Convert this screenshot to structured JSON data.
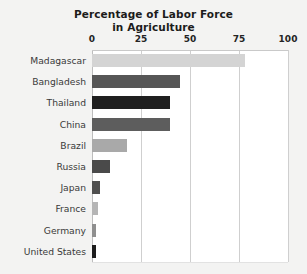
{
  "chart_data": {
    "type": "bar",
    "orientation": "horizontal",
    "title": "Percentage of Labor Force in Agriculture",
    "title_line1": "Percentage of Labor Force",
    "title_line2": "in Agriculture",
    "xlabel": "",
    "ylabel": "",
    "xlim": [
      0,
      100
    ],
    "xticks": [
      0,
      25,
      50,
      75,
      100
    ],
    "xtick_labels": [
      "0",
      "25",
      "50",
      "75",
      "100"
    ],
    "grid": "vertical",
    "legend": "none",
    "categories": [
      "Madagascar",
      "Bangladesh",
      "Thailand",
      "China",
      "Brazil",
      "Russia",
      "Japan",
      "France",
      "Germany",
      "United States"
    ],
    "values": [
      78,
      45,
      40,
      40,
      18,
      9,
      4,
      3,
      2,
      2
    ],
    "bar_colors": [
      "#d4d4d4",
      "#565656",
      "#1f1f1f",
      "#5d5d5d",
      "#a9a9a9",
      "#4a4a4a",
      "#4f4f4f",
      "#b5b5b5",
      "#8f8f8f",
      "#1c1c1c"
    ],
    "colors": {
      "background": "#f3f3f2",
      "plot_background": "#ffffff",
      "gridline": "#cfcfcf",
      "axis": "#bdbdbd",
      "text": "#242424",
      "label_text": "#3a3a3a"
    }
  }
}
